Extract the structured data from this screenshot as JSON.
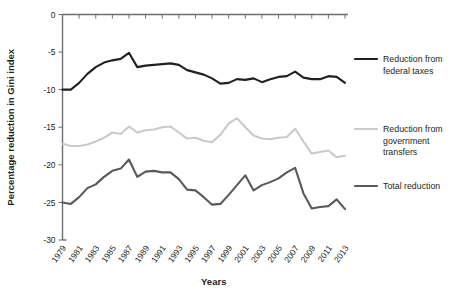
{
  "chart_data": {
    "type": "line",
    "title": "",
    "xlabel": "Years",
    "ylabel": "Percentage reduction in Gini index",
    "grid": false,
    "legend_position": "right",
    "xlim": [
      1979,
      2013
    ],
    "ylim": [
      -30,
      0
    ],
    "yticks": [
      0,
      -5,
      -10,
      -15,
      -20,
      -25,
      -30
    ],
    "ytick_labels": [
      "0",
      "-5",
      "-10",
      "-15",
      "-20",
      "-25",
      "-30"
    ],
    "x": [
      1979,
      1980,
      1981,
      1982,
      1983,
      1984,
      1985,
      1986,
      1987,
      1988,
      1989,
      1990,
      1991,
      1992,
      1993,
      1994,
      1995,
      1996,
      1997,
      1998,
      1999,
      2000,
      2001,
      2002,
      2003,
      2004,
      2005,
      2006,
      2007,
      2008,
      2009,
      2010,
      2011,
      2012,
      2013
    ],
    "xtick_labels": [
      "1979",
      "1981",
      "1983",
      "1985",
      "1987",
      "1989",
      "1991",
      "1993",
      "1995",
      "1997",
      "1999",
      "2001",
      "2003",
      "2005",
      "2007",
      "2009",
      "2011",
      "2013"
    ],
    "series": [
      {
        "name": "Reduction from federal taxes",
        "color": "#231f20",
        "width": 2.1,
        "values": [
          -10.0,
          -10.0,
          -9.1,
          -7.9,
          -7.0,
          -6.4,
          -6.1,
          -5.9,
          -5.1,
          -7.0,
          -6.8,
          -6.7,
          -6.6,
          -6.5,
          -6.7,
          -7.4,
          -7.7,
          -8.0,
          -8.5,
          -9.2,
          -9.1,
          -8.6,
          -8.7,
          -8.5,
          -9.0,
          -8.6,
          -8.3,
          -8.2,
          -7.6,
          -8.4,
          -8.6,
          -8.6,
          -8.2,
          -8.3,
          -9.1
        ]
      },
      {
        "name": "Reduction from government transfers",
        "color": "#c9cacb",
        "width": 2.1,
        "values": [
          -17.2,
          -17.5,
          -17.5,
          -17.3,
          -16.9,
          -16.4,
          -15.7,
          -15.9,
          -14.9,
          -15.7,
          -15.4,
          -15.3,
          -15.0,
          -14.9,
          -15.7,
          -16.5,
          -16.4,
          -16.8,
          -17.0,
          -16.0,
          -14.5,
          -13.8,
          -15.0,
          -16.1,
          -16.5,
          -16.6,
          -16.4,
          -16.3,
          -15.2,
          -16.9,
          -18.5,
          -18.3,
          -18.1,
          -19.0,
          -18.8
        ]
      },
      {
        "name": "Total reduction",
        "color": "#58595b",
        "width": 2.1,
        "values": [
          -25.0,
          -25.2,
          -24.3,
          -23.1,
          -22.6,
          -21.6,
          -20.8,
          -20.5,
          -19.3,
          -21.6,
          -20.9,
          -20.8,
          -21.0,
          -21.0,
          -21.9,
          -23.3,
          -23.4,
          -24.3,
          -25.3,
          -25.2,
          -24.0,
          -22.7,
          -21.4,
          -23.4,
          -22.7,
          -22.3,
          -21.8,
          -21.0,
          -20.4,
          -23.8,
          -25.8,
          -25.6,
          -25.5,
          -24.6,
          -25.9
        ]
      }
    ]
  },
  "legend": {
    "items": [
      {
        "label_line1": "Reduction from",
        "label_line2": "federal taxes",
        "label_line3": "",
        "color": "#231f20"
      },
      {
        "label_line1": "Reduction from",
        "label_line2": "government",
        "label_line3": "transfers",
        "color": "#c9cacb"
      },
      {
        "label_line1": "Total reduction",
        "label_line2": "",
        "label_line3": "",
        "color": "#58595b"
      }
    ]
  },
  "axes": {
    "y_title": "Percentage reduction in Gini index",
    "x_title": "Years"
  }
}
